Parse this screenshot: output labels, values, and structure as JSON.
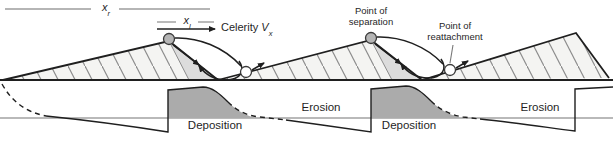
{
  "measurements": {
    "x_r": {
      "base": "x",
      "sub": "r"
    },
    "x_l": {
      "base": "x",
      "sub": "l"
    }
  },
  "celerity": {
    "word": "Celerity",
    "symbol": "V",
    "sub": "x"
  },
  "annotations": {
    "separation": {
      "line1": "Point of",
      "line2": "separation"
    },
    "reattachment": {
      "line1": "Point of",
      "line2": "reattachment"
    }
  },
  "zones": {
    "erosion_left": "Erosion",
    "erosion_right": "Erosion",
    "deposition_left": "Deposition",
    "deposition_right": "Deposition"
  },
  "palette": {
    "outline": "#1f1f1f",
    "dune_fill": "#f4f4f2",
    "hatch": "#8c8c8c",
    "lee_strip": "#dcdcdc",
    "deposition_fill": "#ababab",
    "guide_line": "#9c9c9c",
    "baseline": "#b9b9b9",
    "separation_marker": "#b5b5b5",
    "reattachment_marker": "#ffffff"
  }
}
